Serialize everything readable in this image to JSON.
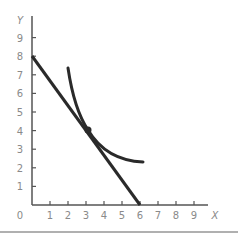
{
  "chart_data": {
    "type": "line",
    "title": "",
    "xlabel": "X",
    "ylabel": "Y",
    "xlim": [
      0,
      9
    ],
    "ylim": [
      0,
      9
    ],
    "grid": false,
    "legend": null,
    "origin_label": "0",
    "x_ticks": [
      "1",
      "2",
      "3",
      "4",
      "5",
      "6",
      "7",
      "8",
      "9"
    ],
    "y_ticks": [
      "1",
      "2",
      "3",
      "4",
      "5",
      "6",
      "7",
      "8",
      "9"
    ],
    "series": [
      {
        "name": "budget-line",
        "kind": "straight line",
        "points": [
          [
            0,
            8
          ],
          [
            6,
            0
          ]
        ]
      },
      {
        "name": "indifference-curve",
        "kind": "convex curve",
        "points": [
          [
            2.0,
            7.3
          ],
          [
            2.5,
            5.3
          ],
          [
            3.0,
            4.0
          ],
          [
            4.0,
            2.9
          ],
          [
            5.0,
            2.45
          ],
          [
            6.1,
            2.3
          ]
        ]
      }
    ],
    "annotations": [
      {
        "type": "point",
        "label": "tangency",
        "x": 3,
        "y": 4
      }
    ]
  },
  "colors": {
    "line": "#2a2a2a",
    "axis": "#555555",
    "labels": "#8a8a8a",
    "rule": "#b0b0b0"
  }
}
